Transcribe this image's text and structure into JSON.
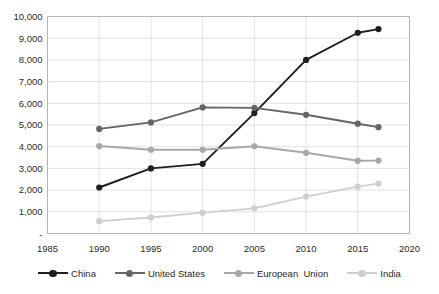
{
  "chart_data": {
    "type": "line",
    "title": "",
    "subtitle": "",
    "xlabel": "",
    "ylabel": "",
    "xlim": [
      1985,
      2020
    ],
    "ylim": [
      0,
      10000
    ],
    "grid": true,
    "legend_position": "bottom",
    "x_tick_labels": [
      "1985",
      "1990",
      "1995",
      "2000",
      "2005",
      "2010",
      "2015",
      "2020"
    ],
    "x_ticks": [
      1985,
      1990,
      1995,
      2000,
      2005,
      2010,
      2015,
      2020
    ],
    "y_tick_labels": [
      "-",
      "1,000",
      "2,000",
      "3,000",
      "4,000",
      "5,000",
      "6,000",
      "7,000",
      "8,000",
      "9,000",
      "10,000"
    ],
    "y_ticks": [
      0,
      1000,
      2000,
      3000,
      4000,
      5000,
      6000,
      7000,
      8000,
      9000,
      10000
    ],
    "x": [
      1990,
      1995,
      2000,
      2005,
      2010,
      2015,
      2017
    ],
    "series": [
      {
        "name": "China",
        "color": "#1f1f1f",
        "values": [
          2120,
          3000,
          3210,
          5550,
          8000,
          9250,
          9420
        ]
      },
      {
        "name": "United States",
        "color": "#656565",
        "values": [
          4820,
          5120,
          5810,
          5790,
          5470,
          5060,
          4900
        ]
      },
      {
        "name": "European  Union",
        "color": "#a8a8a8",
        "values": [
          4030,
          3860,
          3860,
          4020,
          3720,
          3350,
          3360
        ]
      },
      {
        "name": "India",
        "color": "#cfcfcf",
        "values": [
          570,
          740,
          960,
          1160,
          1700,
          2160,
          2300
        ]
      }
    ]
  },
  "legend": {
    "items": [
      {
        "label": "China",
        "color": "#1f1f1f"
      },
      {
        "label": "United States",
        "color": "#656565"
      },
      {
        "label": "European  Union",
        "color": "#a8a8a8"
      },
      {
        "label": "India",
        "color": "#cfcfcf"
      }
    ]
  }
}
